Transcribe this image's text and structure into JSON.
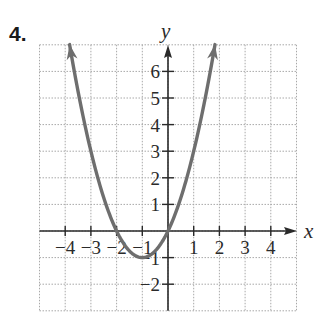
{
  "problem_number": "4.",
  "colors": {
    "curve": "#6e6e6e",
    "axis": "#2a2a2a",
    "grid": "#a8a8a8",
    "background": "#ffffff"
  },
  "chart_data": {
    "type": "line",
    "title": "",
    "function": "y = x^2 + 2x",
    "xlabel": "x",
    "ylabel": "y",
    "xlim": [
      -5,
      5
    ],
    "ylim": [
      -3,
      7
    ],
    "grid": true,
    "grid_style": "dotted",
    "x_ticks": [
      -4,
      -3,
      -2,
      -1,
      1,
      2,
      3,
      4
    ],
    "x_tick_labels": [
      "−4",
      "−3",
      "−2",
      "−1",
      "1",
      "2",
      "3",
      "4"
    ],
    "y_ticks": [
      -2,
      -1,
      1,
      2,
      3,
      4,
      5,
      6
    ],
    "y_tick_labels": [
      "−2",
      "−1",
      "1",
      "2",
      "3",
      "4",
      "5",
      "6"
    ],
    "series": [
      {
        "name": "parabola",
        "points": [
          {
            "x": -3.83,
            "y": 7
          },
          {
            "x": -3,
            "y": 3
          },
          {
            "x": -2,
            "y": 0
          },
          {
            "x": -1,
            "y": -1
          },
          {
            "x": 0,
            "y": 0
          },
          {
            "x": 1,
            "y": 3
          },
          {
            "x": 1.83,
            "y": 7
          }
        ],
        "vertex": {
          "x": -1,
          "y": -1
        },
        "x_intercepts": [
          -2,
          0
        ],
        "arrows_at_ends": true
      }
    ]
  }
}
